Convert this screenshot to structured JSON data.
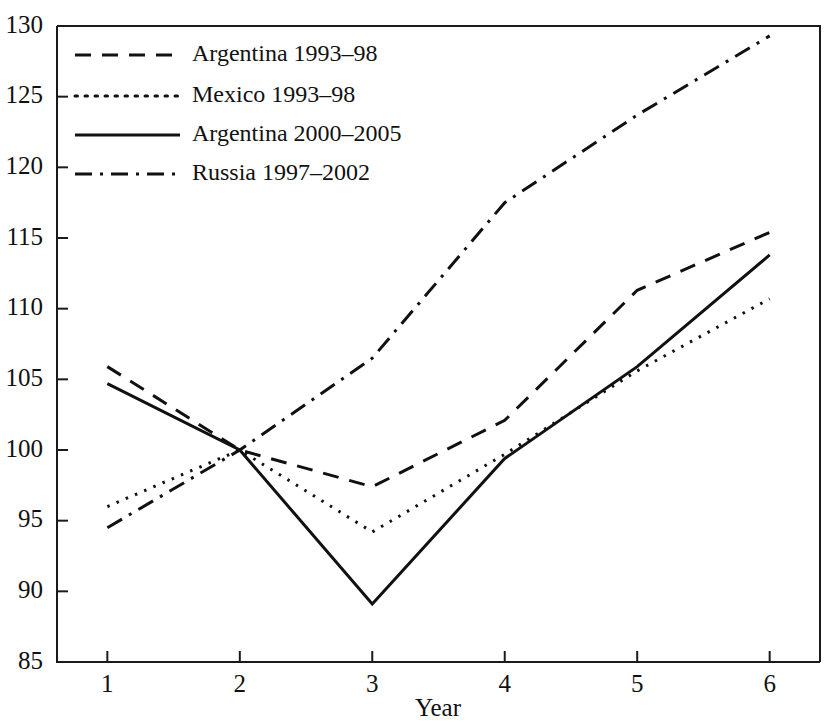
{
  "chart_data": {
    "type": "line",
    "title": "",
    "xlabel": "Year",
    "ylabel": "",
    "x": [
      1,
      2,
      3,
      4,
      5,
      6
    ],
    "xtick_labels": [
      "1",
      "2",
      "3",
      "4",
      "5",
      "6"
    ],
    "ytick_labels": [
      "85",
      "90",
      "95",
      "100",
      "105",
      "110",
      "115",
      "120",
      "125",
      "130"
    ],
    "ytick_values": [
      85,
      90,
      95,
      100,
      105,
      110,
      115,
      120,
      125,
      130
    ],
    "xlim": [
      0.62,
      6.38
    ],
    "ylim": [
      85,
      130
    ],
    "grid": false,
    "legend_position": "top-left",
    "series": [
      {
        "name": "Argentina 1993–98",
        "dash": "dashed",
        "values": [
          105.9,
          100.0,
          97.4,
          102.1,
          111.3,
          115.4
        ]
      },
      {
        "name": "Mexico 1993–98",
        "dash": "dotted",
        "values": [
          96.0,
          100.0,
          94.2,
          99.7,
          105.6,
          110.7
        ]
      },
      {
        "name": "Argentina 2000–2005",
        "dash": "solid",
        "values": [
          104.7,
          100.0,
          89.1,
          99.4,
          105.9,
          113.8
        ]
      },
      {
        "name": "Russia 1997–2002",
        "dash": "dash-dot",
        "values": [
          94.5,
          100.0,
          106.5,
          117.5,
          123.7,
          129.3
        ]
      }
    ]
  },
  "legend": {
    "entries": [
      {
        "label": "Argentina 1993–98"
      },
      {
        "label": "Mexico 1993–98"
      },
      {
        "label": "Argentina 2000–2005"
      },
      {
        "label": "Russia 1997–2002"
      }
    ]
  },
  "axes": {
    "x_title": "Year"
  },
  "clipped_header": ""
}
